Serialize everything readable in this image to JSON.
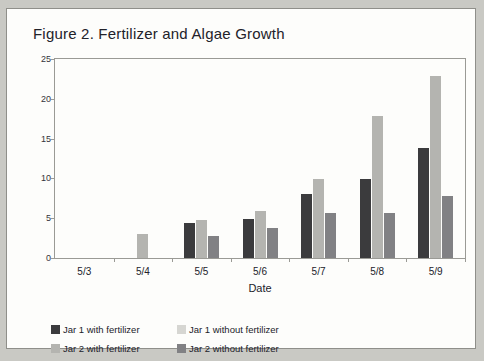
{
  "figure": {
    "title": "Figure 2. Fertilizer and Algae Growth"
  },
  "chart_data": {
    "type": "bar",
    "title": "Figure 2. Fertilizer and Algae Growth",
    "xlabel": "Date",
    "ylabel": "Diameter of algae (mm)",
    "categories": [
      "5/3",
      "5/4",
      "5/5",
      "5/6",
      "5/7",
      "5/8",
      "5/9"
    ],
    "ylim": [
      0,
      25
    ],
    "yticks": [
      0,
      5,
      10,
      15,
      20,
      25
    ],
    "ytick_labels": [
      "0",
      "5",
      "10",
      "15",
      "20",
      "25"
    ],
    "grid": false,
    "legend_position": "bottom-left",
    "series": [
      {
        "name": "Jar 1 with fertilizer",
        "color": "#3b3b3d",
        "values": [
          0,
          0,
          4.4,
          4.9,
          8.0,
          9.9,
          13.8
        ]
      },
      {
        "name": "Jar 1 without fertilizer",
        "color": "#d6d6d2",
        "values": [
          0,
          0,
          0,
          0,
          0,
          0,
          0
        ]
      },
      {
        "name": "Jar 2 with fertilizer",
        "color": "#b4b4b0",
        "values": [
          0,
          3.0,
          4.8,
          5.9,
          9.9,
          17.8,
          22.9
        ]
      },
      {
        "name": "Jar 2 without fertilizer",
        "color": "#818184",
        "values": [
          0,
          0,
          2.8,
          3.8,
          5.7,
          5.6,
          7.8
        ]
      }
    ]
  }
}
